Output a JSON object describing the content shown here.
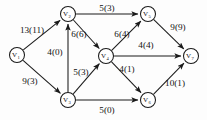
{
  "diagram": {
    "type": "flow-network",
    "title": "",
    "notation": "capacity(flow)",
    "colors": {
      "background": "#fdfdfd",
      "stroke": "#1a1a1a",
      "text": "#111111",
      "node_fill": "#ffffff"
    },
    "nodes": [
      {
        "id": "v1",
        "label": "V",
        "subscript": "1",
        "x": 17,
        "y": 55,
        "r": 7.5,
        "role": "source"
      },
      {
        "id": "v2",
        "label": "V",
        "subscript": "2",
        "x": 68,
        "y": 14,
        "r": 7.5,
        "role": "intermediate"
      },
      {
        "id": "v3",
        "label": "V",
        "subscript": "3",
        "x": 68,
        "y": 100,
        "r": 7.5,
        "role": "intermediate"
      },
      {
        "id": "v4",
        "label": "V",
        "subscript": "4",
        "x": 106,
        "y": 56,
        "r": 7.5,
        "role": "intermediate"
      },
      {
        "id": "v5",
        "label": "V",
        "subscript": "5",
        "x": 148,
        "y": 14,
        "r": 7.5,
        "role": "intermediate"
      },
      {
        "id": "v6",
        "label": "V",
        "subscript": "6",
        "x": 148,
        "y": 100,
        "r": 7.5,
        "role": "intermediate"
      },
      {
        "id": "v7",
        "label": "V",
        "subscript": "7",
        "x": 191,
        "y": 56,
        "r": 7.5,
        "role": "sink"
      }
    ],
    "edges": [
      {
        "id": "e1",
        "from": "v1",
        "to": "v2",
        "capacity": 13,
        "flow": 11,
        "label": "13(11)",
        "label_x": 32,
        "label_y": 30
      },
      {
        "id": "e2",
        "from": "v1",
        "to": "v3",
        "capacity": 9,
        "flow": 3,
        "label": "9(3)",
        "label_x": 30,
        "label_y": 81
      },
      {
        "id": "e3",
        "from": "v2",
        "to": "v5",
        "capacity": 5,
        "flow": 3,
        "label": "5(3)",
        "label_x": 107,
        "label_y": 8
      },
      {
        "id": "e4",
        "from": "v2",
        "to": "v4",
        "capacity": 6,
        "flow": 6,
        "label": "6(6)",
        "label_x": 79,
        "label_y": 34
      },
      {
        "id": "e5",
        "from": "v3",
        "to": "v2",
        "capacity": 4,
        "flow": 0,
        "label": "4(0)",
        "label_x": 55,
        "label_y": 52
      },
      {
        "id": "e6",
        "from": "v3",
        "to": "v4",
        "capacity": 5,
        "flow": 3,
        "label": "5(3)",
        "label_x": 81,
        "label_y": 72
      },
      {
        "id": "e7",
        "from": "v3",
        "to": "v6",
        "capacity": 5,
        "flow": 0,
        "label": "5(0)",
        "label_x": 107,
        "label_y": 110
      },
      {
        "id": "e8",
        "from": "v4",
        "to": "v5",
        "capacity": 6,
        "flow": 4,
        "label": "6(4)",
        "label_x": 122,
        "label_y": 34
      },
      {
        "id": "e9",
        "from": "v4",
        "to": "v7",
        "capacity": 4,
        "flow": 4,
        "label": "4(4)",
        "label_x": 146,
        "label_y": 45
      },
      {
        "id": "e10",
        "from": "v4",
        "to": "v6",
        "capacity": 4,
        "flow": 1,
        "label": "4(1)",
        "label_x": 127,
        "label_y": 69
      },
      {
        "id": "e11",
        "from": "v5",
        "to": "v7",
        "capacity": 9,
        "flow": 9,
        "label": "9(9)",
        "label_x": 178,
        "label_y": 27
      },
      {
        "id": "e12",
        "from": "v6",
        "to": "v7",
        "capacity": 10,
        "flow": 1,
        "label": "10(1)",
        "label_x": 175,
        "label_y": 83
      }
    ]
  }
}
